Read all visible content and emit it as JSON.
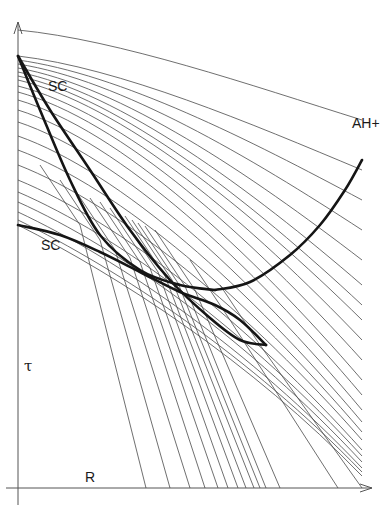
{
  "labels": {
    "sc_upper": "SC",
    "sc_lower": "SC",
    "ah_plus": "AH+",
    "tau": "τ",
    "r": "R"
  },
  "colors": {
    "background": "#ffffff",
    "thin_line": "#4a4a4a",
    "thick_curve": "#151515",
    "axis": "#555555"
  },
  "axes": {
    "origin": [
      18,
      498
    ],
    "y_axis_top": 22,
    "x_axis_right": 372,
    "y_label": "τ",
    "x_label": "R"
  },
  "diagram": {
    "thick_curves": [
      {
        "name": "sc-upper-envelope",
        "points": [
          [
            18,
            56
          ],
          [
            50,
            110
          ],
          [
            90,
            170
          ],
          [
            130,
            230
          ],
          [
            170,
            280
          ],
          [
            210,
            318
          ],
          [
            240,
            340
          ],
          [
            266,
            345
          ]
        ]
      },
      {
        "name": "sc-lower-envelope",
        "points": [
          [
            18,
            225
          ],
          [
            60,
            235
          ],
          [
            100,
            252
          ],
          [
            140,
            272
          ],
          [
            180,
            292
          ],
          [
            215,
            305
          ],
          [
            240,
            320
          ],
          [
            266,
            345
          ]
        ]
      },
      {
        "name": "sc-inner-cusp-curve",
        "points": [
          [
            18,
            56
          ],
          [
            40,
            110
          ],
          [
            70,
            180
          ],
          [
            100,
            235
          ],
          [
            140,
            270
          ],
          [
            180,
            285
          ],
          [
            215,
            290
          ]
        ]
      },
      {
        "name": "ah-plus-curve",
        "points": [
          [
            215,
            290
          ],
          [
            250,
            282
          ],
          [
            290,
            255
          ],
          [
            320,
            225
          ],
          [
            345,
            190
          ],
          [
            362,
            160
          ]
        ]
      }
    ],
    "thin_curve_count": 30
  }
}
